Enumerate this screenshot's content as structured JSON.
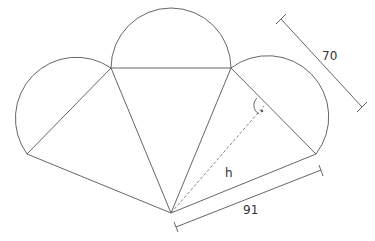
{
  "diagram": {
    "type": "cone net (triangles with semicircles)",
    "labels": {
      "side_length": "70",
      "base_length": "91",
      "height": "h"
    },
    "colors": {
      "stroke": "#555555",
      "dashed": "#777777",
      "background": "#ffffff"
    }
  }
}
